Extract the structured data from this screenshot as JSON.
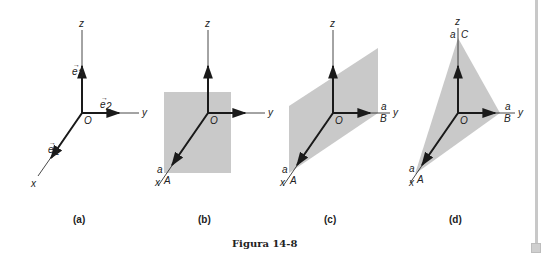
{
  "figure": {
    "caption": "Figura 14-8",
    "colors": {
      "axis": "#1a1a1a",
      "plane_fill": "#c9c9c9",
      "text": "#222222"
    },
    "panels": [
      {
        "id": "a",
        "label": "(a)",
        "axes": {
          "x": "x",
          "y": "y",
          "z": "z",
          "origin": "O"
        },
        "vectors": [
          "e1",
          "e2",
          "e3"
        ],
        "vector_labels": {
          "e1": "e",
          "e1_sub": "1",
          "e2": "e",
          "e2_sub": "2",
          "e3": "e",
          "e3_sub": "3"
        },
        "shape": "none"
      },
      {
        "id": "b",
        "label": "(b)",
        "axes": {
          "x": "x",
          "y": "y",
          "z": "z",
          "origin": "O"
        },
        "points": {
          "A": "A"
        },
        "intercepts": {
          "x": "a"
        },
        "shape": "plane x = a (rectangle)"
      },
      {
        "id": "c",
        "label": "(c)",
        "axes": {
          "x": "x",
          "y": "y",
          "z": "z",
          "origin": "O"
        },
        "points": {
          "A": "A",
          "B": "B"
        },
        "intercepts": {
          "x": "a",
          "y": "a"
        },
        "shape": "plane x + y = a (parallelogram)"
      },
      {
        "id": "d",
        "label": "(d)",
        "axes": {
          "x": "x",
          "y": "y",
          "z": "z",
          "origin": "O"
        },
        "points": {
          "A": "A",
          "B": "B",
          "C": "C"
        },
        "intercepts": {
          "x": "a",
          "y": "a",
          "z": "a"
        },
        "shape": "plane x + y + z = a (triangle ABC)"
      }
    ]
  },
  "scrollbar": {
    "orientation": "vertical"
  }
}
